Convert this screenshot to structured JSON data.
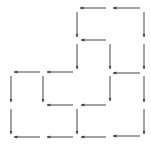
{
  "diagram": {
    "type": "directed-grid-path",
    "background": "#ffffff",
    "stroke_color": "#444444",
    "grid": {
      "columns_x": [
        11,
        43,
        77,
        110,
        144
      ],
      "rows_y": [
        8,
        40,
        72,
        105,
        137
      ]
    },
    "arrows": [
      {
        "x1": 140,
        "y1": 8,
        "x2": 113,
        "y2": 8,
        "dir": "left"
      },
      {
        "x1": 106,
        "y1": 8,
        "x2": 80,
        "y2": 8,
        "dir": "left"
      },
      {
        "x1": 77,
        "y1": 12,
        "x2": 77,
        "y2": 37,
        "dir": "down"
      },
      {
        "x1": 144,
        "y1": 12,
        "x2": 144,
        "y2": 37,
        "dir": "down"
      },
      {
        "x1": 106,
        "y1": 40,
        "x2": 81,
        "y2": 40,
        "dir": "left"
      },
      {
        "x1": 77,
        "y1": 44,
        "x2": 77,
        "y2": 69,
        "dir": "down"
      },
      {
        "x1": 110,
        "y1": 44,
        "x2": 110,
        "y2": 69,
        "dir": "down"
      },
      {
        "x1": 144,
        "y1": 44,
        "x2": 144,
        "y2": 69,
        "dir": "down"
      },
      {
        "x1": 40,
        "y1": 72,
        "x2": 14,
        "y2": 72,
        "dir": "left"
      },
      {
        "x1": 73,
        "y1": 72,
        "x2": 47,
        "y2": 72,
        "dir": "left"
      },
      {
        "x1": 140,
        "y1": 73,
        "x2": 113,
        "y2": 73,
        "dir": "left"
      },
      {
        "x1": 11,
        "y1": 76,
        "x2": 11,
        "y2": 102,
        "dir": "down"
      },
      {
        "x1": 43,
        "y1": 76,
        "x2": 43,
        "y2": 102,
        "dir": "down"
      },
      {
        "x1": 110,
        "y1": 76,
        "x2": 110,
        "y2": 101,
        "dir": "down"
      },
      {
        "x1": 144,
        "y1": 76,
        "x2": 144,
        "y2": 102,
        "dir": "down"
      },
      {
        "x1": 73,
        "y1": 105,
        "x2": 47,
        "y2": 105,
        "dir": "left"
      },
      {
        "x1": 106,
        "y1": 105,
        "x2": 81,
        "y2": 105,
        "dir": "left"
      },
      {
        "x1": 11,
        "y1": 109,
        "x2": 11,
        "y2": 134,
        "dir": "down"
      },
      {
        "x1": 77,
        "y1": 109,
        "x2": 77,
        "y2": 134,
        "dir": "down"
      },
      {
        "x1": 144,
        "y1": 109,
        "x2": 144,
        "y2": 134,
        "dir": "down"
      },
      {
        "x1": 40,
        "y1": 137,
        "x2": 14,
        "y2": 137,
        "dir": "left"
      },
      {
        "x1": 73,
        "y1": 137,
        "x2": 47,
        "y2": 137,
        "dir": "left"
      },
      {
        "x1": 106,
        "y1": 137,
        "x2": 81,
        "y2": 137,
        "dir": "left"
      },
      {
        "x1": 140,
        "y1": 136,
        "x2": 113,
        "y2": 136,
        "dir": "left"
      }
    ]
  }
}
